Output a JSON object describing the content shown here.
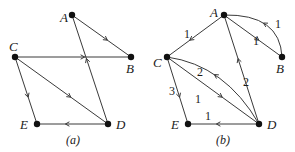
{
  "graphs": [
    {
      "id": "a",
      "caption": "(a)",
      "weighted": false,
      "nodes": [
        {
          "id": "A",
          "label": "A"
        },
        {
          "id": "B",
          "label": "B"
        },
        {
          "id": "C",
          "label": "C"
        },
        {
          "id": "D",
          "label": "D"
        },
        {
          "id": "E",
          "label": "E"
        }
      ],
      "edges": [
        {
          "from": "A",
          "to": "B",
          "weight": null,
          "curved": false
        },
        {
          "from": "C",
          "to": "B",
          "weight": null,
          "curved": false
        },
        {
          "from": "C",
          "to": "E",
          "weight": null,
          "curved": false
        },
        {
          "from": "C",
          "to": "D",
          "weight": null,
          "curved": false
        },
        {
          "from": "D",
          "to": "A",
          "weight": null,
          "curved": false
        },
        {
          "from": "D",
          "to": "E",
          "weight": null,
          "curved": false
        }
      ]
    },
    {
      "id": "b",
      "caption": "(b)",
      "weighted": true,
      "nodes": [
        {
          "id": "A",
          "label": "A"
        },
        {
          "id": "B",
          "label": "B"
        },
        {
          "id": "C",
          "label": "C"
        },
        {
          "id": "D",
          "label": "D"
        },
        {
          "id": "E",
          "label": "E"
        }
      ],
      "edges": [
        {
          "from": "A",
          "to": "C",
          "weight": "1",
          "curved": false
        },
        {
          "from": "A",
          "to": "B",
          "weight": "1",
          "curved": false
        },
        {
          "from": "B",
          "to": "A",
          "weight": "1",
          "curved": true
        },
        {
          "from": "D",
          "to": "A",
          "weight": "2",
          "curved": false
        },
        {
          "from": "D",
          "to": "C",
          "weight": "2",
          "curved": true
        },
        {
          "from": "C",
          "to": "D",
          "weight": "1",
          "curved": false
        },
        {
          "from": "C",
          "to": "E",
          "weight": "3",
          "curved": false
        },
        {
          "from": "D",
          "to": "E",
          "weight": "1",
          "curved": false
        }
      ]
    }
  ]
}
